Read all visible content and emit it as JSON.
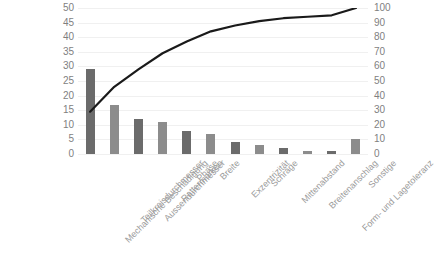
{
  "chart_data": {
    "type": "bar",
    "title": "",
    "subtitle": "",
    "xlabel": "",
    "ylabel": "",
    "y2label": "",
    "grid": true,
    "legend": "none",
    "categories": [
      "Mechanische Beschädigung",
      "Teilkreisdurchmesser",
      "Aussendurchmesser",
      "Rattermarken",
      "Phase",
      "Breite",
      "Exzentrizität",
      "Schräge",
      "Mittenabstand",
      "Breitenanschlag",
      "Form- und Lagetoleranz",
      "Sonstige"
    ],
    "series": [
      {
        "name": "Anzahl",
        "type": "bar",
        "axis": "left",
        "values": [
          29,
          16.7,
          12,
          11,
          8,
          7,
          4,
          3,
          2,
          1,
          1,
          5
        ]
      },
      {
        "name": "Kumuliert %",
        "type": "line",
        "axis": "right",
        "values": [
          29,
          46,
          58,
          69,
          77,
          84,
          88,
          91,
          93,
          94,
          95,
          100
        ]
      }
    ],
    "ylim": [
      0,
      50
    ],
    "y2lim": [
      0,
      100
    ],
    "yticks": [
      0,
      5,
      10,
      15,
      20,
      25,
      30,
      35,
      40,
      45,
      50
    ],
    "y2ticks": [
      0,
      10,
      20,
      30,
      40,
      50,
      60,
      70,
      80,
      90,
      100
    ],
    "bar_colors": [
      "#6b6b6b",
      "#8c8c8c"
    ],
    "line_color": "#1a1a1a",
    "grid_color": "#f0f0f0",
    "tick_label_color": "#7f7f7f",
    "category_label_color": "#9a9a9a"
  },
  "axis": {
    "left_ticks": [
      "50",
      "45",
      "40",
      "35",
      "30",
      "25",
      "20",
      "15",
      "10",
      "5",
      "0"
    ],
    "right_ticks": [
      "100",
      "90",
      "80",
      "70",
      "60",
      "50",
      "40",
      "30",
      "20",
      "10",
      "0"
    ]
  }
}
